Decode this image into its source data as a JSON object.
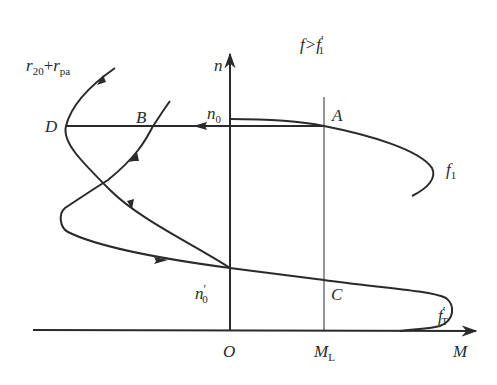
{
  "figure": {
    "condition_label": "f>f′1",
    "condition": {
      "main": "f>f",
      "prime": "′",
      "sub": "1"
    },
    "axes": {
      "x_axis": {
        "label": "M"
      },
      "y_axis": {
        "label": "n"
      },
      "origin": "O",
      "marker_x": {
        "main": "M",
        "sub": "L"
      }
    },
    "points": {
      "A": "A",
      "B": "B",
      "C": "C",
      "D": "D",
      "n0": {
        "main": "n",
        "sub": "0"
      },
      "n0_prime": {
        "main": "n",
        "prime": "′",
        "sub": "0"
      }
    },
    "curves": {
      "f1": {
        "main": "f",
        "sub": "1"
      },
      "fT_prime": {
        "main": "f",
        "prime": "′",
        "sub": "T"
      },
      "resistance": {
        "r1": "r",
        "s1": "20",
        "plus": "+",
        "r2": "r",
        "s2": "pa"
      }
    },
    "colors": {
      "ink": "#2a2a2a",
      "background": "#ffffff"
    }
  }
}
